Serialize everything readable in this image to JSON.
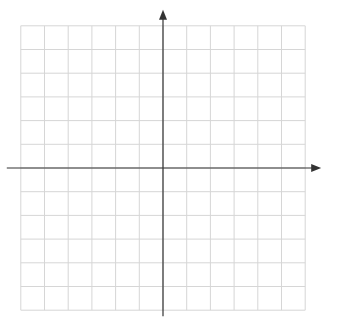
{
  "diagram": {
    "type": "coordinate-grid",
    "x_range": [
      -6,
      6
    ],
    "y_range": [
      -6,
      6
    ],
    "x_axis_label": "x",
    "y_axis_label": "y",
    "origin_label": "0",
    "x_ticks": [
      "-6",
      "-5",
      "-4",
      "-3",
      "-2",
      "-1",
      "1",
      "2",
      "3",
      "4",
      "5",
      "6"
    ],
    "y_ticks": [
      "6",
      "5",
      "4",
      "3",
      "2",
      "1",
      "-1",
      "-2",
      "-3",
      "-4",
      "-5",
      "-6"
    ],
    "shapes": [
      {
        "label": "Q",
        "vertices": [
          [
            1,
            -2
          ],
          [
            2,
            -1
          ],
          [
            4,
            -1
          ],
          [
            4,
            -2
          ]
        ]
      }
    ],
    "colors": {
      "grid": "#d6d6d6",
      "axis": "#333333",
      "shape": "#222222"
    }
  }
}
